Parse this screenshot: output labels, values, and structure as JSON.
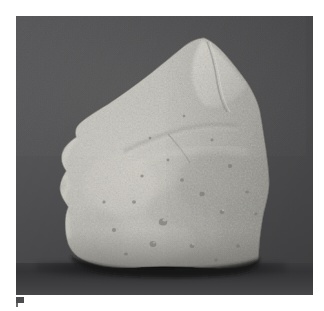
{
  "page": {
    "background_color": "#ffffff",
    "width": 324,
    "height": 311
  },
  "photograph": {
    "label": "rock-specimen-photograph",
    "frame": {
      "left": 16,
      "top": 16,
      "width": 297,
      "height": 279
    },
    "background_color": "#4b4b4d",
    "surface_color": "#37373a",
    "shadow_color": "#101012"
  },
  "specimen": {
    "name": "triangular-rock-specimen",
    "description": "Light gray porous triangular rock fragment resting on a dark surface",
    "body_color": "#b4b3ad",
    "highlight_color": "#d6d4cd",
    "shade_color": "#8d8c86",
    "apex": {
      "x": 205,
      "y": 38
    }
  },
  "caption": {
    "mark": "",
    "text": ""
  }
}
